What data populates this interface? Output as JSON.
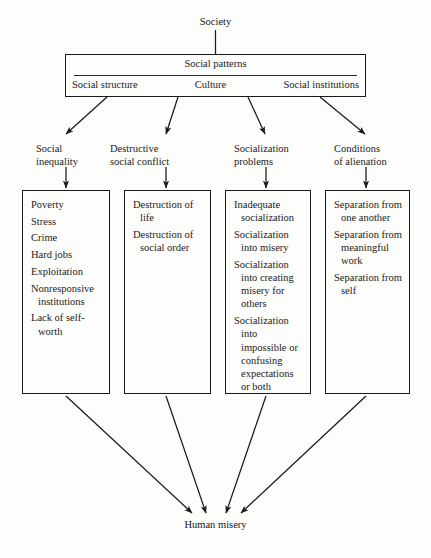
{
  "diagram": {
    "root": {
      "label": "Society"
    },
    "banner": {
      "title": "Social patterns",
      "components": [
        {
          "label": "Social structure"
        },
        {
          "label": "Culture"
        },
        {
          "label": "Social institutions"
        }
      ]
    },
    "sink": {
      "label": "Human misery"
    },
    "columns": [
      {
        "category": "Social\ninequality",
        "items": [
          "Poverty",
          "Stress",
          "Crime",
          "Hard jobs",
          "Exploitation",
          "Nonresponsive institutions",
          "Lack of self-worth"
        ]
      },
      {
        "category": "Destructive\nsocial conflict",
        "items": [
          "Destruction of life",
          "Destruction of social order"
        ]
      },
      {
        "category": "Socialization\nproblems",
        "items": [
          "Inadequate socialization",
          "Socialization into misery",
          "Socialization into creating misery for others",
          "Socialization into impossible or confusing expectations or both"
        ]
      },
      {
        "category": "Conditions\nof alienation",
        "items": [
          "Separation from one another",
          "Separation from meaningful work",
          "Separation from self"
        ]
      }
    ]
  },
  "style": {
    "ink": "#1a1a1a",
    "paper": "#fdfdfc"
  }
}
